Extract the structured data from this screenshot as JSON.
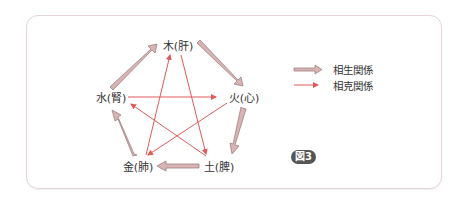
{
  "diagram": {
    "type": "five-elements-cycle",
    "nodes": [
      {
        "id": "wood",
        "label": "木(肝)",
        "x": 178,
        "y": 45
      },
      {
        "id": "fire",
        "label": "火(心)",
        "x": 244,
        "y": 97
      },
      {
        "id": "earth",
        "label": "土(脾)",
        "x": 219,
        "y": 166
      },
      {
        "id": "metal",
        "label": "金(肺)",
        "x": 138,
        "y": 166
      },
      {
        "id": "water",
        "label": "水(腎)",
        "x": 111,
        "y": 97
      }
    ],
    "generating_edges": [
      {
        "from": "wood",
        "to": "fire"
      },
      {
        "from": "fire",
        "to": "earth"
      },
      {
        "from": "earth",
        "to": "metal"
      },
      {
        "from": "metal",
        "to": "water"
      },
      {
        "from": "water",
        "to": "wood"
      }
    ],
    "controlling_edges": [
      {
        "from": "wood",
        "to": "earth"
      },
      {
        "from": "earth",
        "to": "water"
      },
      {
        "from": "water",
        "to": "fire"
      },
      {
        "from": "fire",
        "to": "metal"
      },
      {
        "from": "metal",
        "to": "wood"
      }
    ]
  },
  "legend": {
    "generating_label": "相生関係",
    "controlling_label": "相克関係"
  },
  "figure_label": "図3",
  "colors": {
    "generating_fill": "#d8b4b4",
    "generating_stroke": "#a08080",
    "controlling": "#e05a5a",
    "frame_border": "#e8d4d4",
    "badge_bg": "#555555"
  }
}
